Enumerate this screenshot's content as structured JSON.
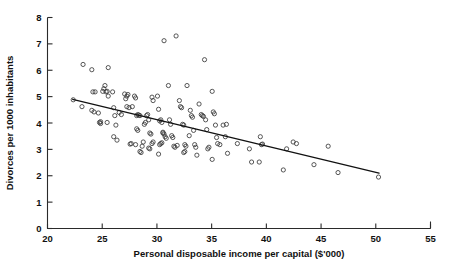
{
  "chart_data": {
    "type": "scatter",
    "title": "",
    "xlabel": "Personal disposable income per capital ($'000)",
    "ylabel": "Divorces per 1000 inhabitants",
    "xlim": [
      20,
      55
    ],
    "ylim": [
      0,
      8
    ],
    "xticks": [
      20,
      25,
      30,
      35,
      40,
      45,
      50,
      55
    ],
    "yticks": [
      0,
      1,
      2,
      3,
      4,
      5,
      6,
      7,
      8
    ],
    "grid": false,
    "legend": null,
    "marker": "open-circle",
    "marker_color": "#3a3a3a",
    "trendline": {
      "type": "linear-fit",
      "x_start": 22.3,
      "y_start": 4.9,
      "x_end": 50.3,
      "y_end": 2.1,
      "color": "#111111"
    },
    "points": [
      [
        22.35,
        4.88
      ],
      [
        23.15,
        4.62
      ],
      [
        23.25,
        6.22
      ],
      [
        24.05,
        6.02
      ],
      [
        24.15,
        5.18
      ],
      [
        24.35,
        5.18
      ],
      [
        24.05,
        4.48
      ],
      [
        24.25,
        4.42
      ],
      [
        24.65,
        4.38
      ],
      [
        24.75,
        4.02
      ],
      [
        24.85,
        4.05
      ],
      [
        24.85,
        3.98
      ],
      [
        25.05,
        5.2
      ],
      [
        25.15,
        5.3
      ],
      [
        25.25,
        5.42
      ],
      [
        25.35,
        5.18
      ],
      [
        25.45,
        5.2
      ],
      [
        25.55,
        5.02
      ],
      [
        25.45,
        4.02
      ],
      [
        25.55,
        6.1
      ],
      [
        25.95,
        5.18
      ],
      [
        26.05,
        4.58
      ],
      [
        26.15,
        4.28
      ],
      [
        26.25,
        3.92
      ],
      [
        26.05,
        3.48
      ],
      [
        26.35,
        3.35
      ],
      [
        26.55,
        4.4
      ],
      [
        26.75,
        4.32
      ],
      [
        27.05,
        5.1
      ],
      [
        27.15,
        4.92
      ],
      [
        27.25,
        5.02
      ],
      [
        27.35,
        5.08
      ],
      [
        27.45,
        4.58
      ],
      [
        27.25,
        4.62
      ],
      [
        27.55,
        3.2
      ],
      [
        27.65,
        3.22
      ],
      [
        27.75,
        4.62
      ],
      [
        27.95,
        5.02
      ],
      [
        28.05,
        4.95
      ],
      [
        28.15,
        4.28
      ],
      [
        28.25,
        4.32
      ],
      [
        28.35,
        4.3
      ],
      [
        28.45,
        4.28
      ],
      [
        28.15,
        3.78
      ],
      [
        28.25,
        3.72
      ],
      [
        28.05,
        3.18
      ],
      [
        28.45,
        2.92
      ],
      [
        28.55,
        2.88
      ],
      [
        28.65,
        3.12
      ],
      [
        28.75,
        3.28
      ],
      [
        28.85,
        3.95
      ],
      [
        28.95,
        4.02
      ],
      [
        29.05,
        4.28
      ],
      [
        29.15,
        4.32
      ],
      [
        29.25,
        4.12
      ],
      [
        29.35,
        3.62
      ],
      [
        29.45,
        3.58
      ],
      [
        29.55,
        4.98
      ],
      [
        29.65,
        4.85
      ],
      [
        29.25,
        3.05
      ],
      [
        29.35,
        3.02
      ],
      [
        29.55,
        3.22
      ],
      [
        29.65,
        3.28
      ],
      [
        30.05,
        5.02
      ],
      [
        30.15,
        4.52
      ],
      [
        30.25,
        4.08
      ],
      [
        30.35,
        4.12
      ],
      [
        30.45,
        4.02
      ],
      [
        30.55,
        3.62
      ],
      [
        30.65,
        3.58
      ],
      [
        30.55,
        3.65
      ],
      [
        30.25,
        3.18
      ],
      [
        30.35,
        3.22
      ],
      [
        30.45,
        3.25
      ],
      [
        30.15,
        2.82
      ],
      [
        30.65,
        7.12
      ],
      [
        30.75,
        3.48
      ],
      [
        30.85,
        3.42
      ],
      [
        31.05,
        5.42
      ],
      [
        31.15,
        4.12
      ],
      [
        31.25,
        3.95
      ],
      [
        31.35,
        3.52
      ],
      [
        31.45,
        3.45
      ],
      [
        31.55,
        3.12
      ],
      [
        31.65,
        3.08
      ],
      [
        31.75,
        7.3
      ],
      [
        31.85,
        3.15
      ],
      [
        32.05,
        4.85
      ],
      [
        32.15,
        4.62
      ],
      [
        32.25,
        4.58
      ],
      [
        32.35,
        3.95
      ],
      [
        32.45,
        3.92
      ],
      [
        32.55,
        3.18
      ],
      [
        32.65,
        3.12
      ],
      [
        32.45,
        2.88
      ],
      [
        32.55,
        2.92
      ],
      [
        32.75,
        5.42
      ],
      [
        32.95,
        3.52
      ],
      [
        33.05,
        4.48
      ],
      [
        33.15,
        4.28
      ],
      [
        33.25,
        4.22
      ],
      [
        33.35,
        3.72
      ],
      [
        33.45,
        3.18
      ],
      [
        33.55,
        3.08
      ],
      [
        33.65,
        2.78
      ],
      [
        33.85,
        4.72
      ],
      [
        34.05,
        4.32
      ],
      [
        34.15,
        4.28
      ],
      [
        34.25,
        4.25
      ],
      [
        34.35,
        6.4
      ],
      [
        34.45,
        4.12
      ],
      [
        34.55,
        3.75
      ],
      [
        34.65,
        3.02
      ],
      [
        34.75,
        3.08
      ],
      [
        35.05,
        5.2
      ],
      [
        35.15,
        4.42
      ],
      [
        35.25,
        4.35
      ],
      [
        35.35,
        3.92
      ],
      [
        35.45,
        3.45
      ],
      [
        35.05,
        2.62
      ],
      [
        35.55,
        3.22
      ],
      [
        35.75,
        3.18
      ],
      [
        36.05,
        3.92
      ],
      [
        36.25,
        3.48
      ],
      [
        36.35,
        3.95
      ],
      [
        36.45,
        2.85
      ],
      [
        37.35,
        3.22
      ],
      [
        38.45,
        3.02
      ],
      [
        38.65,
        2.52
      ],
      [
        39.35,
        2.52
      ],
      [
        39.45,
        3.48
      ],
      [
        39.55,
        3.18
      ],
      [
        39.65,
        3.2
      ],
      [
        41.55,
        2.22
      ],
      [
        41.85,
        3.02
      ],
      [
        42.45,
        3.28
      ],
      [
        42.75,
        3.22
      ],
      [
        44.35,
        2.42
      ],
      [
        45.65,
        3.12
      ],
      [
        46.55,
        2.12
      ],
      [
        50.25,
        1.95
      ]
    ]
  }
}
